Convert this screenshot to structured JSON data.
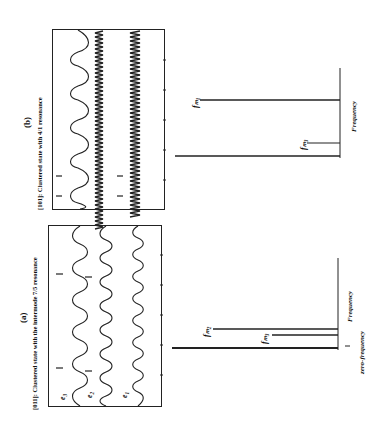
{
  "figure": {
    "orientation": "rotated 90° counter-clockwise",
    "panel_a": {
      "letter": "(a)",
      "caption": "[011]: Clustered state with the intermode 7/5 resonance",
      "traces": [
        "e3",
        "e2",
        "e1"
      ],
      "trace_labels": {
        "e3": "e₃",
        "e2": "e₂",
        "e1": "e₁"
      },
      "spectrum": {
        "axis_label": "Frequency",
        "zero_label": "zero-frequency",
        "peaks": [
          {
            "name": "zero-frequency",
            "label": "",
            "relative_height": 1.0
          },
          {
            "name": "fm2",
            "label": "fₘ₂",
            "relative_height": 0.75
          },
          {
            "name": "fm3",
            "label": "fₘ₃",
            "relative_height": 0.4
          }
        ]
      }
    },
    "panel_b": {
      "letter": "(b)",
      "caption": "[101]: Clustered state with 4/1 resonance",
      "traces": 3,
      "spectrum": {
        "axis_label": "Frequency",
        "peaks": [
          {
            "name": "zero-frequency",
            "label": "",
            "relative_height": 1.0
          },
          {
            "name": "fm1",
            "label": "fₘ₁",
            "relative_height": 0.85
          },
          {
            "name": "fm3",
            "label": "fₘ₃",
            "relative_height": 0.2
          }
        ]
      }
    }
  }
}
